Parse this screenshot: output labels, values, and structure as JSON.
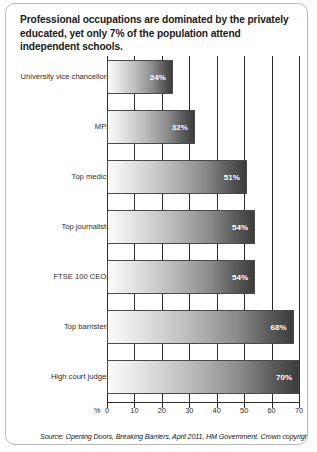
{
  "card": {
    "title": "Professional occupations are dominated by the privately educated, yet only 7% of the population attend independent schools.",
    "source": "Source: Opening Doors, Breaking Barriers, April 2011, HM Government. Crown copyright."
  },
  "axis": {
    "unit_symbol": "%",
    "ticks": [
      "0",
      "10",
      "20",
      "30",
      "40",
      "50",
      "60",
      "70"
    ]
  },
  "chart_data": {
    "type": "bar",
    "orientation": "horizontal",
    "title": "Professional occupations are dominated by the privately educated, yet only 7% of the population attend independent schools.",
    "xlabel": "%",
    "ylabel": "",
    "xlim": [
      0,
      70
    ],
    "xticks": [
      0,
      10,
      20,
      30,
      40,
      50,
      60,
      70
    ],
    "grid": "vertical",
    "legend": "none",
    "value_suffix": "%",
    "categories": [
      "University vice chancellors",
      "MPs",
      "Top medics",
      "Top journalists",
      "FTSE 100 CEOs",
      "Top barristers",
      "High court judges"
    ],
    "values": [
      24,
      32,
      51,
      54,
      54,
      68,
      70
    ],
    "labels": [
      "24%",
      "32%",
      "51%",
      "54%",
      "54%",
      "68%",
      "70%"
    ]
  }
}
